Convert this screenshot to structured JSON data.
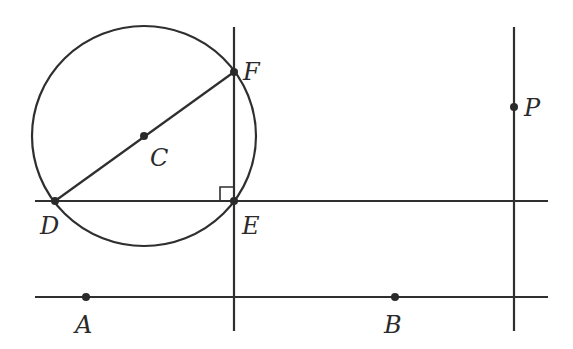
{
  "diagram": {
    "stroke_color": "#2f2f2f",
    "circle": {
      "center_label": "C",
      "cx": 144,
      "cy": 136,
      "rx": 112,
      "ry": 110
    },
    "points": [
      {
        "label": "C",
        "x": 144,
        "y": 136,
        "lx": 150,
        "ly": 166
      },
      {
        "label": "F",
        "x": 234,
        "y": 72,
        "lx": 243,
        "ly": 78
      },
      {
        "label": "D",
        "x": 55,
        "y": 201,
        "lx": 40,
        "ly": 233
      },
      {
        "label": "E",
        "x": 234,
        "y": 201,
        "lx": 243,
        "ly": 233
      },
      {
        "label": "A",
        "x": 86,
        "y": 297,
        "lx": 75,
        "ly": 333
      },
      {
        "label": "B",
        "x": 395,
        "y": 297,
        "lx": 384,
        "ly": 333
      },
      {
        "label": "P",
        "x": 514,
        "y": 107,
        "lx": 524,
        "ly": 116
      }
    ],
    "labels": {
      "C": "C",
      "F": "F",
      "D": "D",
      "E": "E",
      "A": "A",
      "B": "B",
      "P": "P"
    }
  }
}
